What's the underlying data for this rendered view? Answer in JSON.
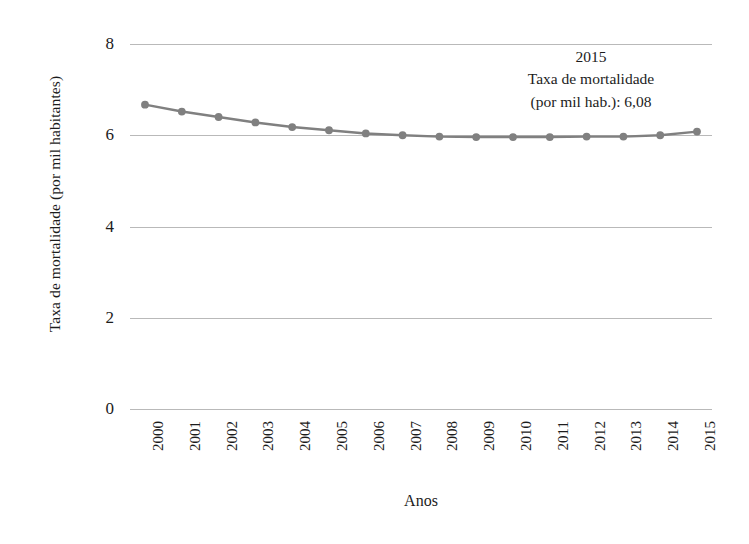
{
  "chart_data": {
    "type": "line",
    "title": "",
    "xlabel": "Anos",
    "ylabel": "Taxa de mortalidade (por mil habitantes)",
    "categories": [
      "2000",
      "2001",
      "2002",
      "2003",
      "2004",
      "2005",
      "2006",
      "2007",
      "2008",
      "2009",
      "2010",
      "2011",
      "2012",
      "2013",
      "2014",
      "2015"
    ],
    "values": [
      6.67,
      6.52,
      6.4,
      6.28,
      6.18,
      6.11,
      6.04,
      6.0,
      5.97,
      5.96,
      5.96,
      5.96,
      5.97,
      5.97,
      6.0,
      6.08
    ],
    "series": [
      {
        "name": "Taxa de mortalidade (por mil hab.)",
        "values": [
          6.67,
          6.52,
          6.4,
          6.28,
          6.18,
          6.11,
          6.04,
          6.0,
          5.97,
          5.96,
          5.96,
          5.96,
          5.97,
          5.97,
          6.0,
          6.08
        ]
      }
    ],
    "ylim": [
      0,
      8
    ],
    "yticks": [
      0,
      2,
      4,
      6,
      8
    ],
    "ytick_labels": [
      "0",
      "2",
      "4",
      "6",
      "8"
    ],
    "grid": "horizontal",
    "legend": "none",
    "xtick_rotation": 90,
    "annotations": [
      {
        "name": "last-point-callout",
        "lines": [
          "2015",
          "Taxa de mortalidade",
          "(por mil hab.): 6,08"
        ],
        "year": "2015",
        "value": "6,08"
      }
    ],
    "colors": {
      "line": "#808080",
      "marker": "#808080",
      "gridline": "#b9b9b9",
      "text": "#1c1c1c",
      "background": "#ffffff"
    }
  }
}
